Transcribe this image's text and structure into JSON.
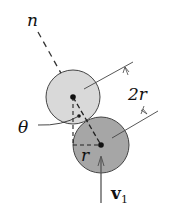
{
  "diagram": {
    "labels": {
      "normal": "n",
      "angle": "θ",
      "diameter": "2r",
      "radius": "r",
      "velocity": "v",
      "velocity_sub": "1"
    },
    "colors": {
      "upper_disk": "#d9d9d9",
      "lower_disk": "#a6a6a6",
      "stroke": "#333333",
      "line": "#555555"
    }
  }
}
